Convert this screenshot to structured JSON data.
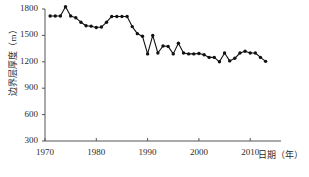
{
  "chart_data": {
    "type": "line",
    "title": "",
    "xlabel": "日期（年）",
    "ylabel": "边界层厚度（m）",
    "xlim": [
      1970,
      2016
    ],
    "ylim": [
      300,
      1800
    ],
    "xticks": [
      1970,
      1980,
      1990,
      2000,
      2010
    ],
    "yticks": [
      300,
      600,
      900,
      1200,
      1500,
      1800
    ],
    "grid": false,
    "legend": null,
    "marker": "filled-circle",
    "line_color": "#111111",
    "marker_color": "#111111",
    "x": [
      1971,
      1972,
      1973,
      1974,
      1975,
      1976,
      1977,
      1978,
      1979,
      1980,
      1981,
      1982,
      1983,
      1984,
      1985,
      1986,
      1987,
      1988,
      1989,
      1990,
      1991,
      1992,
      1993,
      1994,
      1995,
      1996,
      1997,
      1998,
      1999,
      2000,
      2001,
      2002,
      2003,
      2004,
      2005,
      2006,
      2007,
      2008,
      2009,
      2010,
      2011,
      2012,
      2013
    ],
    "values": [
      1720,
      1720,
      1720,
      1825,
      1720,
      1700,
      1650,
      1610,
      1605,
      1590,
      1595,
      1650,
      1715,
      1715,
      1715,
      1715,
      1600,
      1520,
      1490,
      1290,
      1500,
      1300,
      1380,
      1375,
      1290,
      1410,
      1300,
      1290,
      1290,
      1295,
      1280,
      1250,
      1250,
      1200,
      1300,
      1210,
      1240,
      1300,
      1320,
      1300,
      1300,
      1250,
      1205
    ],
    "annotations": []
  },
  "axes": {
    "y_tick_labels": [
      "1800",
      "1500",
      "1200",
      "900",
      "600",
      "300"
    ],
    "x_tick_labels": [
      "1970",
      "1980",
      "1990",
      "2000",
      "2010"
    ],
    "y_axis_title": "边界层厚度（m）",
    "x_axis_title": "日期（年）"
  },
  "caption": ""
}
